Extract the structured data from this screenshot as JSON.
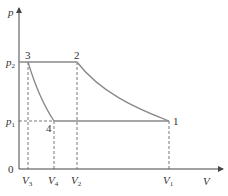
{
  "diagram": {
    "type": "p-V cycle diagram",
    "axes": {
      "y_label": "p",
      "x_label": "V",
      "origin_label": "0"
    },
    "pressure_levels": [
      {
        "base": "p",
        "sub": "2"
      },
      {
        "base": "p",
        "sub": "1"
      }
    ],
    "volume_ticks": [
      {
        "base": "V",
        "sub": "3"
      },
      {
        "base": "V",
        "sub": "4"
      },
      {
        "base": "V",
        "sub": "2"
      },
      {
        "base": "V",
        "sub": "1"
      }
    ],
    "points": [
      {
        "label": "1",
        "state": "p1, V1"
      },
      {
        "label": "2",
        "state": "p2, V2"
      },
      {
        "label": "3",
        "state": "p2, V3"
      },
      {
        "label": "4",
        "state": "p1, V4"
      }
    ],
    "processes": [
      {
        "from": "1",
        "to": "2",
        "shape": "curve"
      },
      {
        "from": "2",
        "to": "3",
        "shape": "isobaric line"
      },
      {
        "from": "3",
        "to": "4",
        "shape": "curve"
      },
      {
        "from": "4",
        "to": "1",
        "shape": "isobaric line"
      }
    ],
    "colors": {
      "axis": "#444444",
      "cycle": "#888888",
      "dashed": "#555555"
    }
  }
}
